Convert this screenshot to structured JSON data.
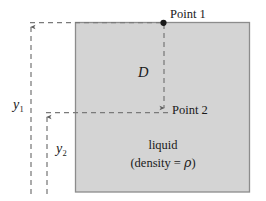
{
  "figure": {
    "type": "physics-fluid-pressure-diagram",
    "background_color": "#ffffff",
    "liquid": {
      "fill_color": "#d4d4d4",
      "border_color": "#8c8c8c",
      "label_line1": "liquid",
      "label_line2_prefix": "(density = ",
      "label_line2_symbol": "ρ",
      "label_line2_suffix": ")"
    },
    "points": [
      {
        "name": "point-1",
        "label": "Point 1",
        "marker": "filled-dot",
        "x": 163,
        "y": 23
      },
      {
        "name": "point-2",
        "label": "Point 2",
        "marker": "arrow-tip",
        "x": 164,
        "y": 113
      }
    ],
    "dimensions": [
      {
        "name": "depth-D",
        "symbol": "D",
        "subscript": "",
        "description": "vertical separation between Point 1 and Point 2"
      },
      {
        "name": "height-y1",
        "symbol": "y",
        "subscript": "1",
        "description": "height of Point 1 above datum"
      },
      {
        "name": "height-y2",
        "symbol": "y",
        "subscript": "2",
        "description": "height of Point 2 above datum"
      }
    ],
    "line_style": {
      "dash_color": "#7a7a7a",
      "dash_pattern": "5,4"
    }
  }
}
